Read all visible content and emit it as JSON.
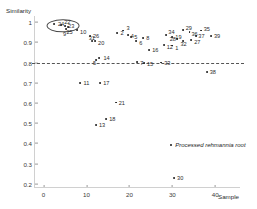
{
  "chart_data": {
    "type": "scatter",
    "title": "",
    "xlabel": "Sample",
    "ylabel": "Similarity",
    "xlim": [
      -2,
      46
    ],
    "ylim": [
      0.18,
      1.03
    ],
    "grid": false,
    "legend_position": "none",
    "xticks": [
      "0",
      "10",
      "20",
      "30",
      "40"
    ],
    "xtick_values": [
      0,
      10,
      20,
      30,
      40
    ],
    "yticks": [
      "0.2",
      "0.3",
      "0.4",
      "0.5",
      "0.6",
      "0.7",
      "0.8",
      "0.9",
      "1"
    ],
    "ytick_values": [
      0.2,
      0.3,
      0.4,
      0.5,
      0.6,
      0.7,
      0.8,
      0.9,
      1.0
    ],
    "threshold": {
      "value": 0.8,
      "style": "dashed",
      "color": "#555555",
      "label": "0.8"
    },
    "highlight_ellipse": {
      "cx": 4.6,
      "cy": 0.982,
      "rx": 3.6,
      "ry": 0.028,
      "color": "#4a4a4a"
    },
    "annotation": {
      "text": "Processed rehmannia root",
      "x": 29.5,
      "y": 0.392,
      "marker": true
    },
    "point_color": "#1a1a1a",
    "points": [
      {
        "label": "24",
        "x": 2.4,
        "y": 0.988,
        "lx": 4,
        "ly": 0
      },
      {
        "label": "22",
        "x": 4.1,
        "y": 0.986,
        "lx": 3,
        "ly": -3
      },
      {
        "label": "23",
        "x": 5.0,
        "y": 0.98,
        "lx": 3,
        "ly": 0
      },
      {
        "label": "25",
        "x": 5.8,
        "y": 0.974,
        "lx": -2,
        "ly": 5
      },
      {
        "label": "9",
        "x": 5.2,
        "y": 0.966,
        "lx": -3,
        "ly": 5
      },
      {
        "label": "10",
        "x": 7.8,
        "y": 0.96,
        "lx": 3,
        "ly": 2
      },
      {
        "label": "26",
        "x": 10.8,
        "y": 0.93,
        "lx": 3,
        "ly": 0
      },
      {
        "label": "20",
        "x": 12.0,
        "y": 0.906,
        "lx": 3,
        "ly": 2
      },
      {
        "label": "31",
        "x": 11.2,
        "y": 0.908,
        "lx": -3,
        "ly": -3
      },
      {
        "label": "14",
        "x": 13.0,
        "y": 0.824,
        "lx": 4,
        "ly": 0
      },
      {
        "label": "5",
        "x": 12.2,
        "y": 0.812,
        "lx": -3,
        "ly": 3
      },
      {
        "label": "2",
        "x": 17.2,
        "y": 0.944,
        "lx": 3,
        "ly": 0
      },
      {
        "label": "3",
        "x": 18.6,
        "y": 0.958,
        "lx": 3,
        "ly": -3
      },
      {
        "label": "4",
        "x": 19.6,
        "y": 0.934,
        "lx": 3,
        "ly": 1
      },
      {
        "label": "5",
        "x": 20.4,
        "y": 0.928,
        "lx": 3,
        "ly": 0
      },
      {
        "label": "6",
        "x": 21.6,
        "y": 0.906,
        "lx": 3,
        "ly": 2
      },
      {
        "label": "8",
        "x": 23.2,
        "y": 0.922,
        "lx": 3,
        "ly": 0
      },
      {
        "label": "7",
        "x": 21.8,
        "y": 0.802,
        "lx": 3,
        "ly": 1
      },
      {
        "label": "15",
        "x": 23.4,
        "y": 0.798,
        "lx": 3,
        "ly": 1
      },
      {
        "label": "16",
        "x": 24.6,
        "y": 0.862,
        "lx": 3,
        "ly": 0
      },
      {
        "label": "33",
        "x": 27.4,
        "y": 0.8,
        "lx": 3,
        "ly": 0
      },
      {
        "label": "34",
        "x": 28.6,
        "y": 0.936,
        "lx": 2,
        "ly": -3
      },
      {
        "label": "19",
        "x": 30.0,
        "y": 0.928,
        "lx": 3,
        "ly": 0
      },
      {
        "label": "12",
        "x": 28.0,
        "y": 0.886,
        "lx": 3,
        "ly": 2
      },
      {
        "label": "1",
        "x": 30.0,
        "y": 0.884,
        "lx": 3,
        "ly": 2
      },
      {
        "label": "29",
        "x": 32.4,
        "y": 0.96,
        "lx": 3,
        "ly": -2
      },
      {
        "label": "36",
        "x": 34.0,
        "y": 0.952,
        "lx": 2,
        "ly": 2
      },
      {
        "label": "35",
        "x": 36.6,
        "y": 0.958,
        "lx": 3,
        "ly": -2
      },
      {
        "label": "37",
        "x": 35.6,
        "y": 0.93,
        "lx": 2,
        "ly": 0
      },
      {
        "label": "27",
        "x": 34.4,
        "y": 0.912,
        "lx": 3,
        "ly": 2
      },
      {
        "label": "32",
        "x": 32.6,
        "y": 0.906,
        "lx": -3,
        "ly": 3
      },
      {
        "label": "28",
        "x": 31.0,
        "y": 0.916,
        "lx": -7,
        "ly": 0
      },
      {
        "label": "39",
        "x": 39.0,
        "y": 0.932,
        "lx": 3,
        "ly": 0
      },
      {
        "label": "11",
        "x": 8.6,
        "y": 0.7,
        "lx": 3,
        "ly": 0
      },
      {
        "label": "17",
        "x": 13.2,
        "y": 0.7,
        "lx": 3,
        "ly": 0
      },
      {
        "label": "21",
        "x": 16.8,
        "y": 0.602,
        "lx": 3,
        "ly": 0
      },
      {
        "label": "18",
        "x": 14.6,
        "y": 0.52,
        "lx": 3,
        "ly": 0
      },
      {
        "label": "13",
        "x": 12.2,
        "y": 0.49,
        "lx": 3,
        "ly": 0
      },
      {
        "label": "38",
        "x": 38.0,
        "y": 0.754,
        "lx": 3,
        "ly": 0
      },
      {
        "label": "30",
        "x": 30.4,
        "y": 0.228,
        "lx": 3,
        "ly": 0
      }
    ]
  }
}
